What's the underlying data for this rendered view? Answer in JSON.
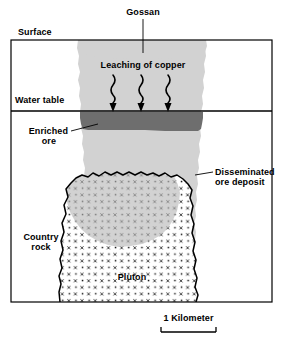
{
  "figure": {
    "type": "geologic-cross-section",
    "title_visible": false,
    "labels": {
      "gossan": "Gossan",
      "surface": "Surface",
      "leaching_of_copper": "Leaching of copper",
      "water_table": "Water table",
      "enriched_ore_line1": "Enriched",
      "enriched_ore_line2": "ore",
      "disseminated_line1": "Disseminated",
      "disseminated_line2": "ore deposit",
      "country_rock_line1": "Country",
      "country_rock_line2": "rock",
      "pluton": "Pluton",
      "scale_bar": "1 Kilometer"
    },
    "colors": {
      "outline": "#000000",
      "background": "#ffffff",
      "leached_zone": "#d2d2d2",
      "enriched_ore_band": "#6e6e6e",
      "disseminated_ore_tint": "#b6b6b6",
      "pluton_fill": "#ffffff",
      "pluton_pattern": "#1a1a1a",
      "text": "#000000"
    },
    "annotations": {
      "gossan_leader": "vertical leader line from Gossan label down to gossan cap",
      "enriched_leader": "short leader from Enriched ore label to dark band",
      "disseminated_leader": "short leader from Disseminated ore deposit label to stippled body",
      "leaching_arrows_count": 3,
      "leaching_arrow_style": "wavy downward arrows"
    },
    "scale": {
      "value": "1 Kilometer",
      "bar_style": "plain bar with upward end ticks"
    }
  }
}
